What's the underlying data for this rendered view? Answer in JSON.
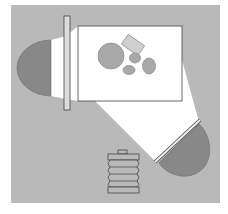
{
  "diagram": {
    "type": "lighting-setup-top-view",
    "colors": {
      "page_background": "#ffffff",
      "floor": "#b9b9b9",
      "light_beam": "#ffffff",
      "light_head": "#888888",
      "diffuser_fill": "#dcdcdc",
      "outline": "#444444",
      "screen": "#ffffff",
      "subject_fill": "#a9a9a9",
      "subject_box_fill": "#cfcfcf",
      "camera_fill": "#b9b9b9"
    },
    "elements": {
      "left_light": {
        "label": ""
      },
      "left_diffuser": {
        "label": ""
      },
      "backdrop_screen": {
        "label": ""
      },
      "subjects": [
        {
          "shape": "circle",
          "label": ""
        },
        {
          "shape": "rectangle",
          "label": ""
        },
        {
          "shape": "ellipse",
          "label": ""
        },
        {
          "shape": "ellipse",
          "label": ""
        },
        {
          "shape": "ellipse",
          "label": ""
        }
      ],
      "right_light": {
        "label": ""
      },
      "right_diffuser": {
        "label": ""
      },
      "camera": {
        "label": ""
      }
    }
  }
}
